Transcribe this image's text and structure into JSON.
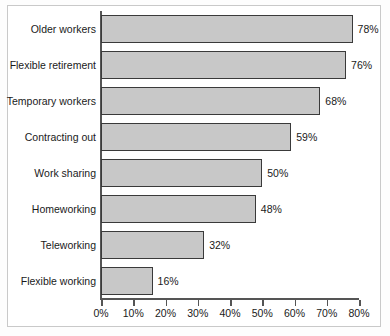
{
  "chart_data": {
    "type": "bar",
    "orientation": "horizontal",
    "title": "",
    "xlabel": "",
    "ylabel": "",
    "categories": [
      "Older workers",
      "Flexible retirement",
      "Temporary workers",
      "Contracting out",
      "Work sharing",
      "Homeworking",
      "Teleworking",
      "Flexible working"
    ],
    "values": [
      78,
      76,
      68,
      59,
      50,
      48,
      32,
      16
    ],
    "value_labels": [
      "78%",
      "76%",
      "68%",
      "59%",
      "50%",
      "48%",
      "32%",
      "16%"
    ],
    "xlim": [
      0,
      80
    ],
    "xticks": [
      0,
      10,
      20,
      30,
      40,
      50,
      60,
      70,
      80
    ],
    "xtick_labels": [
      "0%",
      "10%",
      "20%",
      "30%",
      "40%",
      "50%",
      "60%",
      "70%",
      "80%"
    ],
    "grid": false,
    "legend": null,
    "bar_fill_color": "#c8c8c8",
    "bar_border_color": "#3a3a3a",
    "axis_color": "#555555",
    "text_color": "#1a1a1a",
    "frame_color": "#c9c9c9",
    "background_color": "#ffffff"
  }
}
